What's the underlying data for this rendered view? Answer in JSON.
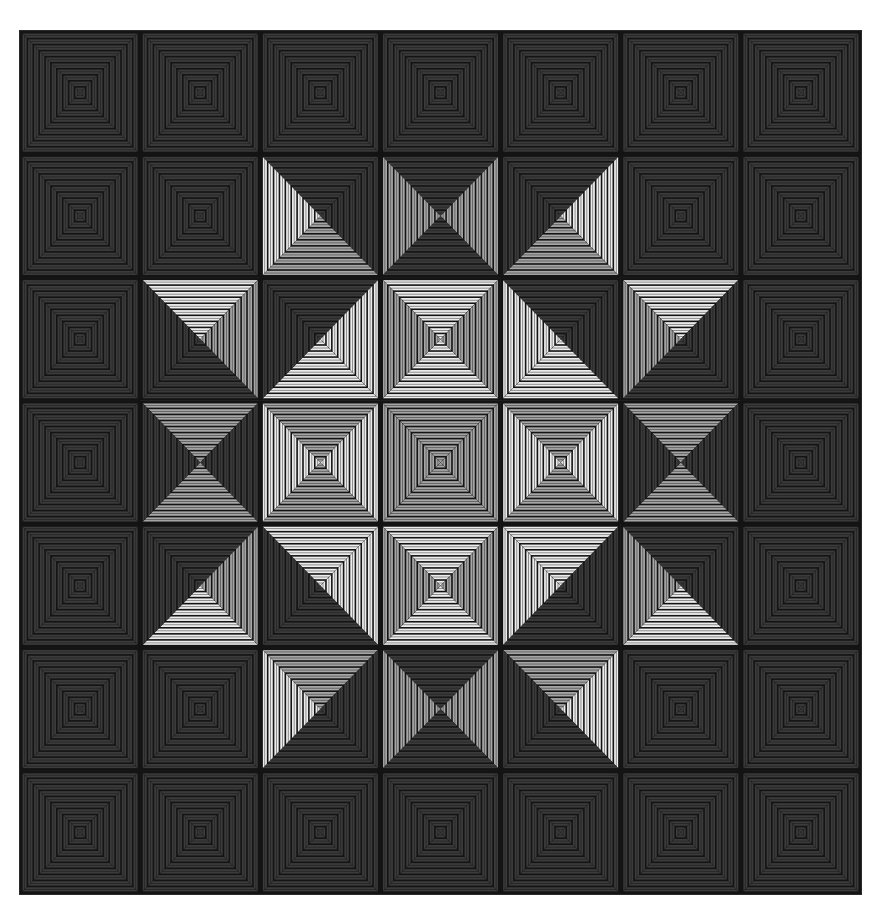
{
  "figure": {
    "description": "Optical illusion: 7x7 grid of concentric-square tiles with triangular quadrant shading",
    "grid": {
      "rows": 7,
      "cols": 7
    },
    "palette": {
      "D": "#3b3b3b",
      "G": "#a6a6a6",
      "W": "#ececec",
      "line": "#141414"
    },
    "rings_per_cell": 10,
    "quadrant_order": [
      "top",
      "right",
      "bottom",
      "left"
    ],
    "cells": [
      [
        "DDDD",
        "DDDD",
        "DDDD",
        "DDDD",
        "DDDD",
        "DDDD",
        "DDDD"
      ],
      [
        "DDDD",
        "DDDD",
        "DDGW",
        "DGDG",
        "DWGD",
        "DDDD",
        "DDDD"
      ],
      [
        "DDDD",
        "WGDD",
        "DWWD",
        "WGWG",
        "DDWW",
        "WDDG",
        "DDDD"
      ],
      [
        "DDDD",
        "GDGD",
        "GWGW",
        "GGGG",
        "GWGW",
        "GDGD",
        "DDDD"
      ],
      [
        "DDDD",
        "DGWD",
        "WWDD",
        "WGWG",
        "WDDW",
        "DDWG",
        "DDDD"
      ],
      [
        "DDDD",
        "DDDD",
        "GDDW",
        "DGDG",
        "GWDD",
        "DDDD",
        "DDDD"
      ],
      [
        "DDDD",
        "DDDD",
        "DDDD",
        "DDDD",
        "DDDD",
        "DDDD",
        "DDDD"
      ]
    ]
  }
}
